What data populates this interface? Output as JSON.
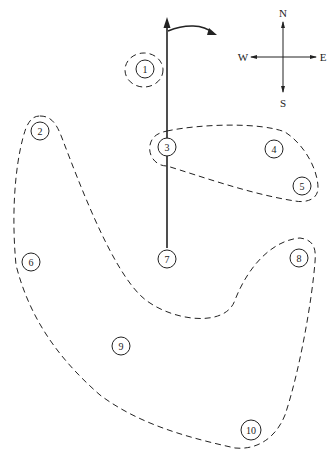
{
  "diagram": {
    "type": "node-cluster-map",
    "colors": {
      "stroke": "#222222",
      "background": "#ffffff"
    },
    "compass": {
      "center": [
        283,
        57
      ],
      "labels": {
        "north": "N",
        "south": "S",
        "west": "W",
        "east": "E"
      }
    },
    "nodes": [
      {
        "id": "1",
        "label": "1",
        "x": 145,
        "y": 69
      },
      {
        "id": "2",
        "label": "2",
        "x": 40,
        "y": 131
      },
      {
        "id": "3",
        "label": "3",
        "x": 167,
        "y": 147
      },
      {
        "id": "4",
        "label": "4",
        "x": 274,
        "y": 149
      },
      {
        "id": "5",
        "label": "5",
        "x": 302,
        "y": 186
      },
      {
        "id": "6",
        "label": "6",
        "x": 31,
        "y": 262
      },
      {
        "id": "7",
        "label": "7",
        "x": 167,
        "y": 259
      },
      {
        "id": "8",
        "label": "8",
        "x": 299,
        "y": 258
      },
      {
        "id": "9",
        "label": "9",
        "x": 121,
        "y": 346
      },
      {
        "id": "10",
        "label": "10",
        "x": 251,
        "y": 430
      }
    ],
    "clusters": [
      {
        "name": "cluster-1",
        "members": [
          "1"
        ]
      },
      {
        "name": "cluster-3-4-5",
        "members": [
          "3",
          "4",
          "5"
        ]
      },
      {
        "name": "cluster-2-6-9-10-8",
        "members": [
          "2",
          "6",
          "9",
          "10",
          "8"
        ]
      }
    ],
    "axis_line": {
      "from_node": "7",
      "direction": "north",
      "through": [
        "3"
      ]
    },
    "rotation_arrow": {
      "direction": "clockwise"
    }
  }
}
